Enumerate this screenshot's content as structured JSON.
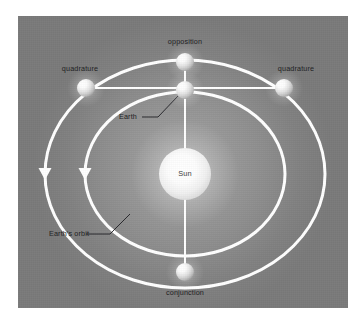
{
  "figure": {
    "background_color": "#8d8d8d",
    "panel_color": "#8d8d8d",
    "orbit_color": "#ffffff",
    "label_color": "#1d1d22",
    "sphere_color": "#f2f2f2"
  },
  "labels": {
    "opposition": "opposition",
    "quadrature_left": "quadrature",
    "quadrature_right": "quadrature",
    "earth": "Earth",
    "sun": "Sun",
    "earths_orbit": "Earth's orbit",
    "conjunction": "conjunction"
  },
  "bodies": [
    {
      "name": "sun",
      "label": "Sun",
      "cx": 167,
      "cy": 158,
      "r": 26,
      "on": "center"
    },
    {
      "name": "earth",
      "label": "Earth",
      "cx": 167,
      "cy": 74,
      "r": 9,
      "on": "earth-orbit"
    },
    {
      "name": "opposition",
      "label": "opposition",
      "cx": 167,
      "cy": 46,
      "r": 9,
      "on": "outer-orbit"
    },
    {
      "name": "quadrature-left",
      "label": "quadrature",
      "cx": 68,
      "cy": 72,
      "r": 9,
      "on": "outer-orbit"
    },
    {
      "name": "quadrature-right",
      "label": "quadrature",
      "cx": 266,
      "cy": 72,
      "r": 9,
      "on": "outer-orbit"
    },
    {
      "name": "conjunction",
      "label": "conjunction",
      "cx": 167,
      "cy": 256,
      "r": 9,
      "on": "outer-orbit"
    }
  ],
  "orbits": [
    {
      "name": "outer-orbit",
      "cx": 167,
      "cy": 158,
      "rx": 140,
      "ry": 114,
      "direction": "counterclockwise",
      "arrow_at": "left"
    },
    {
      "name": "earth-orbit",
      "cx": 167,
      "cy": 158,
      "rx": 100,
      "ry": 82,
      "direction": "counterclockwise",
      "arrow_at": "left",
      "label": "Earth's orbit"
    }
  ],
  "sight_lines": [
    {
      "name": "earth-to-opposition",
      "from": "earth",
      "to": "opposition"
    },
    {
      "name": "earth-to-conjunction",
      "from": "earth",
      "to": "conjunction"
    },
    {
      "name": "earth-to-quadrature-left",
      "from": "earth",
      "to": "quadrature-left"
    },
    {
      "name": "earth-to-quadrature-right",
      "from": "earth",
      "to": "quadrature-right"
    },
    {
      "name": "sun-to-earth",
      "from": "sun",
      "to": "earth"
    }
  ],
  "label_positions": {
    "opposition": {
      "x": 167,
      "y": 26,
      "align": "center"
    },
    "quadrature_left": {
      "x": 62,
      "y": 53,
      "align": "center"
    },
    "quadrature_right": {
      "x": 278,
      "y": 53,
      "align": "center"
    },
    "earth": {
      "x": 134,
      "y": 95,
      "align": "left"
    },
    "sun": {
      "x": 167,
      "y": 155,
      "align": "center"
    },
    "earths_orbit": {
      "x": 63,
      "y": 215,
      "align": "left"
    },
    "conjunction": {
      "x": 167,
      "y": 277,
      "align": "center"
    }
  }
}
